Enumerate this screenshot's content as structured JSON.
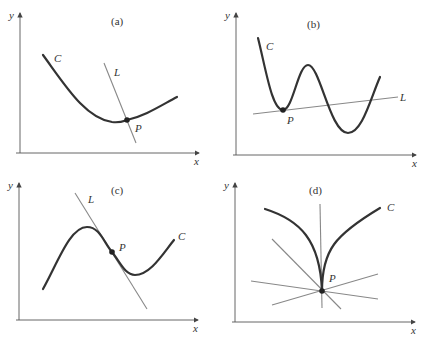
{
  "figure": {
    "panels": [
      {
        "id": "a",
        "title": "(a)",
        "axis_x_label": "x",
        "axis_y_label": "y",
        "curve_label": "C",
        "line_label": "L",
        "point_label": "P",
        "description": "Convex curve C with line L crossing it at P (not tangent)"
      },
      {
        "id": "b",
        "title": "(b)",
        "axis_x_label": "x",
        "axis_y_label": "y",
        "curve_label": "C",
        "line_label": "L",
        "point_label": "P",
        "description": "Wavy curve C touching line L at local minimum P; L intersects C elsewhere"
      },
      {
        "id": "c",
        "title": "(c)",
        "axis_x_label": "x",
        "axis_y_label": "y",
        "curve_label": "C",
        "line_label": "L",
        "point_label": "P",
        "description": "Curve C with tangent line L at inflection point P"
      },
      {
        "id": "d",
        "title": "(d)",
        "axis_x_label": "x",
        "axis_y_label": "y",
        "curve_label": "C",
        "point_label": "P",
        "description": "Curve C with cusp at P; several lines pass through P"
      }
    ],
    "colors": {
      "curve": "#333333",
      "line": "#888888",
      "axis": "#555555",
      "point": "#222222"
    }
  }
}
